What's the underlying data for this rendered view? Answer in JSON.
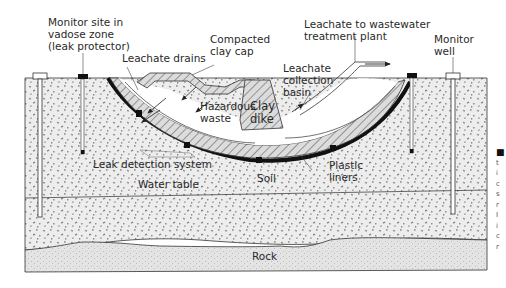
{
  "colors": {
    "soil_fill": "#ececec",
    "rock_fill": "#e2e2e2",
    "clay_hatch": "#d8d8d8",
    "line": "#2b2b2b",
    "liner": "#111111"
  },
  "labels": {
    "monitor_site": [
      "Monitor site in",
      "vadose zone",
      "(leak protector)"
    ],
    "leachate_drains": "Leachate drains",
    "compacted_clay_cap": [
      "Compacted",
      "clay cap"
    ],
    "leachate_to_plant": [
      "Leachate to wastewater",
      "treatment plant"
    ],
    "monitor_well": [
      "Monitor",
      "well"
    ],
    "leachate_collection_basin": [
      "Leachate",
      "collection",
      "basin"
    ],
    "hazardous_waste": [
      "Hazardous",
      "waste"
    ],
    "clay_dike": [
      "Clay",
      "dike"
    ],
    "leak_detection_system": "Leak detection system",
    "water_table": "Water table",
    "soil": "Soil",
    "plastic_liners": [
      "Plastic",
      "liners"
    ],
    "rock": "Rock"
  },
  "margin_fragment": [
    "■",
    "t",
    "i",
    "c",
    "s",
    "r",
    "I",
    "i",
    "c",
    "r"
  ]
}
